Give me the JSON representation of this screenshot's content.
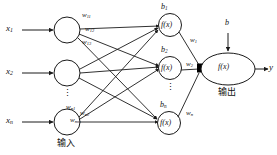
{
  "diagram": {
    "type": "neural-network",
    "inputs": [
      {
        "label": "x",
        "sub": "1"
      },
      {
        "label": "x",
        "sub": "2"
      },
      {
        "label": "x",
        "sub": "n"
      }
    ],
    "input_layer_caption": "输入",
    "output_layer_caption": "输出",
    "hidden_nodes": [
      {
        "bias": "b",
        "bias_sub": "1",
        "activation": "f(x)",
        "out_weight": "w",
        "out_weight_sub": "1"
      },
      {
        "bias": "b",
        "bias_sub": "2",
        "activation": "f(x)",
        "out_weight": "w",
        "out_weight_sub": "2"
      },
      {
        "bias": "b",
        "bias_sub": "n",
        "activation": "f(x)",
        "out_weight": "w",
        "out_weight_sub": "n"
      }
    ],
    "input_weights_top": [
      {
        "label": "w",
        "sub": "11"
      },
      {
        "label": "w",
        "sub": "12"
      },
      {
        "label": "w",
        "sub": "13"
      }
    ],
    "input_weights_bottom": [
      {
        "label": "w",
        "sub": "n1"
      },
      {
        "label": "w",
        "sub": "n2"
      },
      {
        "label": "w",
        "sub": "nm"
      }
    ],
    "output_node": {
      "bias": "b",
      "activation": "f(x)",
      "output": "y"
    },
    "ellipsis": "⋮",
    "colors": {
      "stroke": "#1a1a1a",
      "text": "#111111",
      "background": "#ffffff",
      "junction": "#000000"
    }
  }
}
